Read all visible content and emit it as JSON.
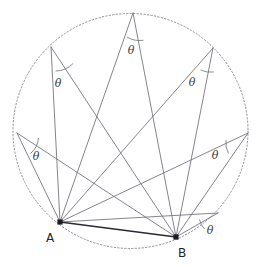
{
  "figure": {
    "name": "inscribed-angle-theorem-diagram",
    "colors": {
      "circle_stroke": "#8e8e99",
      "chord_stroke": "#2a2a33",
      "ray_stroke": "#6e6e7a",
      "arc_stroke": "#6e6e7a",
      "label_color": "#3c3c46",
      "point_color": "#1b1b22",
      "background": "#ffffff"
    },
    "circle": {
      "cx": 130.5,
      "cy": 131.0,
      "r": 117.5,
      "style": "dotted"
    },
    "base_points": [
      {
        "id": "A",
        "label": "A",
        "x": 60.0,
        "y": 222.0,
        "label_x": 50.0,
        "label_y": 241.0
      },
      {
        "id": "B",
        "label": "B",
        "x": 176.0,
        "y": 237.0,
        "label_x": 180.0,
        "label_y": 256.0
      }
    ],
    "apex_points": [
      {
        "id": "P1",
        "x": 51.0,
        "y": 47.0,
        "label": "θ",
        "label_x": 58.0,
        "label_y": 87.0
      },
      {
        "id": "P2",
        "x": 133.0,
        "y": 13.0,
        "label": "θ",
        "label_x": 128.0,
        "label_y": 54.0
      },
      {
        "id": "P3",
        "x": 213.0,
        "y": 48.0,
        "label": "θ",
        "label_x": 190.0,
        "label_y": 86.0
      },
      {
        "id": "P4",
        "x": 17.0,
        "y": 133.0,
        "label": "θ",
        "label_x": 32.0,
        "label_y": 160.0
      },
      {
        "id": "P5",
        "x": 248.0,
        "y": 133.0,
        "label": "θ",
        "label_x": 211.0,
        "label_y": 159.0
      },
      {
        "id": "P6",
        "x": 218.0,
        "y": 213.0,
        "label": "θ",
        "label_x": 205.0,
        "label_y": 233.0
      }
    ],
    "angle_arcs": [
      {
        "for": "P1",
        "d": "M 55.5 71.0 A 24 24 0 0 0 73.0 63.5"
      },
      {
        "for": "P2",
        "d": "M 128.0 37.0 A 24 24 0 0 0 143.5 40.2"
      },
      {
        "for": "P3",
        "d": "M 203.0 69.5 A 24 24 0 0 0 213.8 72.0"
      },
      {
        "for": "P4",
        "d": "M 30.5 153.0 A 22 22 0 0 0 38.2 138.5"
      },
      {
        "for": "P5",
        "d": "M 226.5 140.5 A 22 22 0 0 0 228.0 153.5"
      },
      {
        "for": "P6",
        "d": "M 199.0 220.0 A 19 19 0 0 0 203.0 229.5"
      }
    ],
    "theta_symbol": "θ"
  }
}
